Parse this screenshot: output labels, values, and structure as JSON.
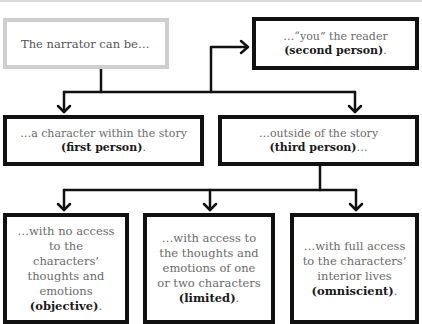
{
  "diagram": {
    "root": {
      "text": "The narrator can be…"
    },
    "second_person": {
      "text": "…“you” the reader",
      "label": "(second person)",
      "suffix": "."
    },
    "first_person": {
      "text": "…a character within the story",
      "label": "(first person)",
      "suffix": "."
    },
    "third_person": {
      "text": "…outside of the story",
      "label": "(third person)",
      "suffix": "…"
    },
    "objective": {
      "text": "…with no access to the characters’ thoughts and emotions",
      "label": "(objective)",
      "suffix": "."
    },
    "limited": {
      "text": "…with access to the thoughts and emotions of one or two characters",
      "label": "(limited)",
      "suffix": "."
    },
    "omniscient": {
      "text": "…with full access to the characters’ interior lives",
      "label": "(omniscient)",
      "suffix": "."
    },
    "edges": [
      {
        "from": "root",
        "to": "first_person"
      },
      {
        "from": "root",
        "to": "second_person"
      },
      {
        "from": "root",
        "to": "third_person"
      },
      {
        "from": "third_person",
        "to": "objective"
      },
      {
        "from": "third_person",
        "to": "limited"
      },
      {
        "from": "third_person",
        "to": "omniscient"
      }
    ],
    "colors": {
      "root_border": "#cfcfcf",
      "box_border": "#111111",
      "body_text": "#6b6b6b",
      "bold_text": "#1a1a1a"
    }
  }
}
